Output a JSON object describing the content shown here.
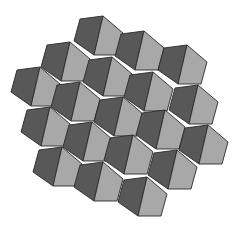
{
  "figure": {
    "width": 240,
    "height": 225,
    "colors": {
      "background": "#ffffff",
      "dark": "#585858",
      "light": "#a8a8a8",
      "edge": "#2a2a2a"
    },
    "template": {
      "dark": [
        [
          -23,
          3
        ],
        [
          0,
          0
        ],
        [
          -9,
          39
        ],
        [
          -29,
          25
        ]
      ],
      "light": [
        [
          0,
          0
        ],
        [
          20,
          17
        ],
        [
          14,
          39
        ],
        [
          -9,
          39
        ]
      ]
    },
    "rows": [
      {
        "name": "row-1",
        "anchors": [
          [
            103,
            16
          ],
          [
            144,
            31
          ],
          [
            187,
            45
          ]
        ]
      },
      {
        "name": "row-2",
        "anchors": [
          [
            70,
            42
          ],
          [
            112,
            57
          ],
          [
            153,
            72
          ],
          [
            198,
            85
          ]
        ]
      },
      {
        "name": "row-3",
        "anchors": [
          [
            40,
            67
          ],
          [
            80,
            82
          ],
          [
            123,
            97
          ],
          [
            165,
            110
          ],
          [
            208,
            125
          ]
        ]
      },
      {
        "name": "row-4",
        "anchors": [
          [
            50,
            107
          ],
          [
            92,
            122
          ],
          [
            133,
            135
          ],
          [
            177,
            150
          ]
        ]
      },
      {
        "name": "row-5",
        "anchors": [
          [
            62,
            147
          ],
          [
            103,
            162
          ],
          [
            147,
            177
          ]
        ]
      }
    ]
  }
}
